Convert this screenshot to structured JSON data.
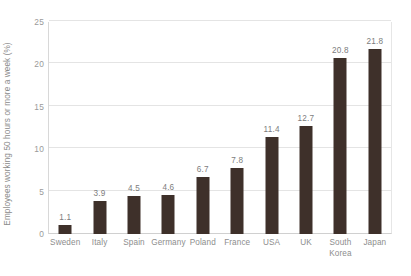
{
  "chart_data": {
    "type": "bar",
    "title": "",
    "xlabel": "",
    "ylabel": "Employees working 50 hours or more a week (%)",
    "categories": [
      "Sweden",
      "Italy",
      "Spain",
      "Germany",
      "Poland",
      "France",
      "USA",
      "UK",
      "South Korea",
      "Japan"
    ],
    "values": [
      1.1,
      3.9,
      4.5,
      4.6,
      6.7,
      7.8,
      11.4,
      12.7,
      20.8,
      21.8
    ],
    "value_labels": [
      "1.1",
      "3.9",
      "4.5",
      "4.6",
      "6.7",
      "7.8",
      "11.4",
      "12.7",
      "20.8",
      "21.8"
    ],
    "ylim": [
      0,
      25
    ],
    "yticks": [
      0,
      5,
      10,
      15,
      20,
      25
    ],
    "ytick_labels": [
      "0",
      "5",
      "10",
      "15",
      "20",
      "25"
    ],
    "grid": true,
    "grid_axis": "y",
    "legend": false,
    "legend_position": "none",
    "bar_color": "#3e302a",
    "grid_color": "#e4e4e4",
    "text_color": "#8d8d8d",
    "background_color": "#ffffff"
  }
}
